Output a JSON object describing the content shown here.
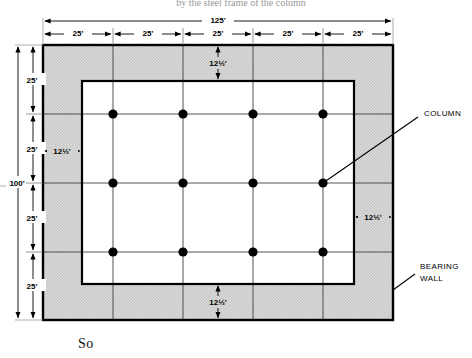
{
  "figure": {
    "type": "architectural-floor-plan",
    "top_caption": "by the steel frame of the column",
    "bottom_caption": "So",
    "plan": {
      "overall_width_label": "125'",
      "overall_height_label": "100'",
      "bay_width_labels": [
        "25'",
        "25'",
        "25'",
        "25'",
        "25'"
      ],
      "bay_height_labels": [
        "25'",
        "25'",
        "25'",
        "25'"
      ],
      "wall_offset_labels": {
        "top": "12½'",
        "bottom": "12½'",
        "left": "12½'",
        "right": "12½'"
      }
    },
    "callouts": [
      {
        "name": "column",
        "line1": "COLUMN",
        "line2": ""
      },
      {
        "name": "bearing-wall",
        "line1": "BEARING",
        "line2": "WALL"
      }
    ],
    "columns": {
      "count": 12,
      "rows": 3,
      "cols": 4,
      "grid_label": "column grid 4 x 3"
    },
    "colors": {
      "shading": "#d9d9d9",
      "line": "#000000",
      "grid_line": "#3a3a3a",
      "background": "#ffffff"
    }
  }
}
